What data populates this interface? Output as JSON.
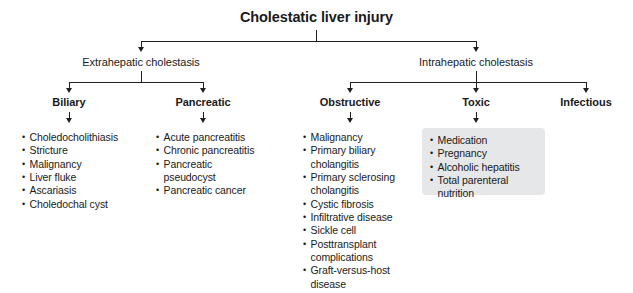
{
  "diagram": {
    "title": "Cholestatic liver injury",
    "level2": [
      {
        "label": "Extrahepatic cholestasis"
      },
      {
        "label": "Intrahepatic cholestasis"
      }
    ],
    "level3": [
      {
        "label": "Biliary"
      },
      {
        "label": "Pancreatic"
      },
      {
        "label": "Obstructive"
      },
      {
        "label": "Toxic"
      },
      {
        "label": "Infectious"
      }
    ],
    "lists": {
      "biliary": [
        [
          "Choledocholithiasis"
        ],
        [
          "Stricture"
        ],
        [
          "Malignancy"
        ],
        [
          "Liver fluke"
        ],
        [
          "Ascariasis"
        ],
        [
          "Choledochal cyst"
        ]
      ],
      "pancreatic": [
        [
          "Acute pancreatitis"
        ],
        [
          "Chronic pancreatitis"
        ],
        [
          "Pancreatic",
          "pseudocyst"
        ],
        [
          "Pancreatic cancer"
        ]
      ],
      "obstructive": [
        [
          "Malignancy"
        ],
        [
          "Primary biliary",
          "cholangitis"
        ],
        [
          "Primary sclerosing",
          "cholangitis"
        ],
        [
          "Cystic fibrosis"
        ],
        [
          "Infiltrative disease"
        ],
        [
          "Sickle cell"
        ],
        [
          "Posttransplant",
          "complications"
        ],
        [
          "Graft-versus-host",
          "disease"
        ]
      ],
      "toxic": [
        [
          "Medication"
        ],
        [
          "Pregnancy"
        ],
        [
          "Alcoholic hepatitis"
        ],
        [
          "Total parenteral",
          "nutrition"
        ]
      ],
      "infectious": []
    }
  },
  "colors": {
    "line": "#231f20",
    "text": "#1a1a1a",
    "highlight": "#e6e7e8",
    "background": "#ffffff"
  }
}
